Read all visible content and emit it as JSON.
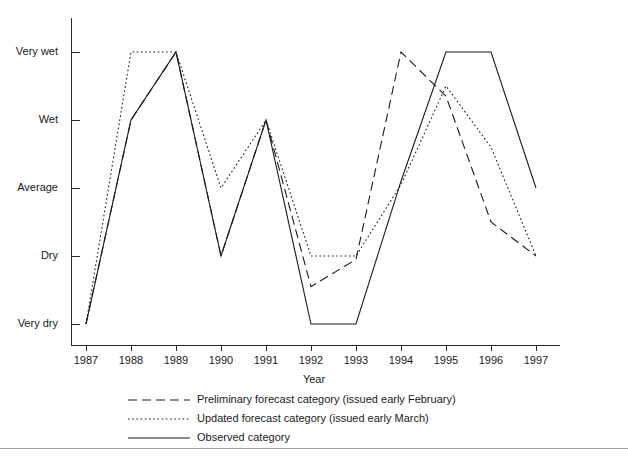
{
  "chart_data": {
    "type": "line",
    "title": "",
    "xlabel": "Year",
    "ylabel": "",
    "x": [
      1987,
      1988,
      1989,
      1990,
      1991,
      1992,
      1993,
      1994,
      1995,
      1996,
      1997
    ],
    "xtick_labels": [
      "1987",
      "1988",
      "1989",
      "1990",
      "1991",
      "1992",
      "1993",
      "1994",
      "1995",
      "1996",
      "1997"
    ],
    "ytick_labels": [
      "Very wet",
      "Wet",
      "Average",
      "Dry",
      "Very dry"
    ],
    "ytick_values": [
      5,
      4,
      3,
      2,
      1
    ],
    "ylim": [
      0.55,
      5.45
    ],
    "xlim": [
      1986.6,
      1997.4
    ],
    "grid": false,
    "legend_position": "below-axes",
    "category_scale": {
      "Very dry": 1,
      "Dry": 2,
      "Average": 3,
      "Wet": 4,
      "Very wet": 5
    },
    "series": [
      {
        "name": "Preliminary forecast category (issued early February)",
        "style": "dashed",
        "color": "#1a1a1a",
        "values": [
          1.0,
          4.0,
          5.0,
          2.0,
          4.0,
          1.55,
          1.95,
          5.0,
          4.35,
          2.5,
          2.0
        ]
      },
      {
        "name": "Updated forecast category (issued early March)",
        "style": "dotted",
        "color": "#1a1a1a",
        "values": [
          1.0,
          5.0,
          5.0,
          3.0,
          4.0,
          2.0,
          2.0,
          3.05,
          4.5,
          3.6,
          2.0
        ]
      },
      {
        "name": "Observed category",
        "style": "solid",
        "color": "#1a1a1a",
        "values": [
          1.0,
          4.0,
          5.0,
          2.0,
          4.0,
          1.0,
          1.0,
          3.1,
          5.0,
          5.0,
          3.0
        ]
      }
    ]
  },
  "legend": {
    "items": [
      {
        "label": "Preliminary forecast category (issued early February)",
        "style": "dashed"
      },
      {
        "label": "Updated forecast category (issued early March)",
        "style": "dotted"
      },
      {
        "label": "Observed category",
        "style": "solid"
      }
    ]
  },
  "axes": {
    "x_title": "Year"
  }
}
